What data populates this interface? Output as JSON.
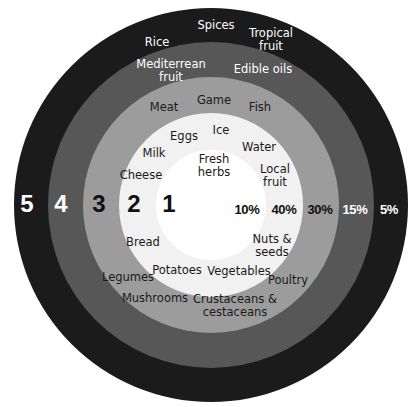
{
  "diagram": {
    "type": "concentric-rings",
    "center": {
      "x": 211,
      "y": 205
    },
    "rings": [
      {
        "level": "5",
        "percent": "5%",
        "radius": 197,
        "color": "#1b1b1b",
        "text_color": "#ffffff",
        "items": [
          "Rice",
          "Spices",
          "Tropical fruit"
        ]
      },
      {
        "level": "4",
        "percent": "15%",
        "radius": 163,
        "color": "#575757",
        "text_color": "#ffffff",
        "items": [
          "Mediterrean fruit",
          "Edible oils"
        ]
      },
      {
        "level": "3",
        "percent": "30%",
        "radius": 128,
        "color": "#9c9c9c",
        "text_color": "#1a1a1a",
        "items": [
          "Meat",
          "Game",
          "Fish",
          "Legumes",
          "Mushrooms",
          "Crustaceans & cestaceans",
          "Poultry"
        ]
      },
      {
        "level": "2",
        "percent": "40%",
        "radius": 92,
        "color": "#f1f1f1",
        "text_color": "#1a1a1a",
        "items": [
          "Eggs",
          "Ice",
          "Milk",
          "Water",
          "Cheese",
          "Local fruit",
          "Bread",
          "Nuts & seeds",
          "Potatoes",
          "Vegetables"
        ]
      },
      {
        "level": "1",
        "percent": "10%",
        "radius": 55,
        "color": "#ffffff",
        "text_color": "#1a1a1a",
        "items": [
          "Fresh herbs"
        ]
      }
    ]
  },
  "labels": {
    "rice": "Rice",
    "spices": "Spices",
    "tropical_fruit_1": "Tropical",
    "tropical_fruit_2": "fruit",
    "mediterrean_fruit_1": "Mediterrean",
    "mediterrean_fruit_2": "fruit",
    "edible_oils": "Edible oils",
    "meat": "Meat",
    "game": "Game",
    "fish": "Fish",
    "eggs": "Eggs",
    "ice": "Ice",
    "milk": "Milk",
    "water": "Water",
    "fresh_herbs_1": "Fresh",
    "fresh_herbs_2": "herbs",
    "cheese": "Cheese",
    "local_fruit_1": "Local",
    "local_fruit_2": "fruit",
    "bread": "Bread",
    "nuts_seeds_1": "Nuts &",
    "nuts_seeds_2": "seeds",
    "legumes": "Legumes",
    "potatoes": "Potatoes",
    "vegetables": "Vegetables",
    "poultry": "Poultry",
    "mushrooms": "Mushrooms",
    "crustaceans_1": "Crustaceans &",
    "crustaceans_2": "cestaceans"
  },
  "levels": {
    "l5": "5",
    "l4": "4",
    "l3": "3",
    "l2": "2",
    "l1": "1"
  },
  "percents": {
    "p1": "10%",
    "p2": "40%",
    "p3": "30%",
    "p4": "15%",
    "p5": "5%"
  }
}
